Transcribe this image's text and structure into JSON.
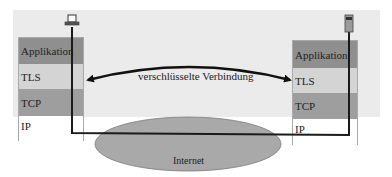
{
  "diagram": {
    "title": "",
    "left_host": {
      "icon": "laptop-icon",
      "layers": [
        "Applikation",
        "TLS",
        "TCP",
        "IP"
      ]
    },
    "right_host": {
      "icon": "mobile-phone-icon",
      "layers": [
        "Applikation",
        "TLS",
        "TCP",
        "IP"
      ]
    },
    "connection_label": "verschlüsselte Verbindung",
    "network_label": "Internet",
    "colors": {
      "background_band": "#ebebeb",
      "application_layer": "#8f8f8f",
      "tls_layer": "#d4d4d4",
      "tcp_layer": "#9e9e9e",
      "ip_layer": "#ffffff",
      "internet_cloud": "#a9a9a9",
      "lines": "#1a1a1a"
    }
  }
}
